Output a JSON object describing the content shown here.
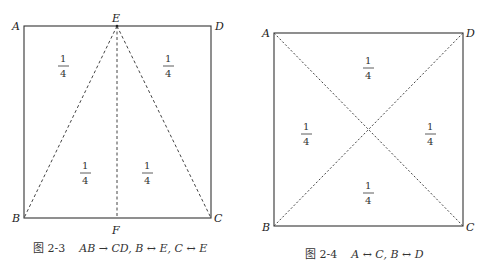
{
  "figures": [
    {
      "id": "fig-2-3",
      "points": {
        "A": "A",
        "D": "D",
        "E": "E",
        "B": "B",
        "F": "F",
        "C": "C"
      },
      "fractions": [
        {
          "num": "1",
          "den": "4"
        },
        {
          "num": "1",
          "den": "4"
        },
        {
          "num": "1",
          "den": "4"
        },
        {
          "num": "1",
          "den": "4"
        }
      ],
      "caption": {
        "label": "图 2-3",
        "math": "AB → CD, B ↔ E, C ↔ E"
      }
    },
    {
      "id": "fig-2-4",
      "points": {
        "A": "A",
        "D": "D",
        "B": "B",
        "C": "C"
      },
      "fractions": [
        {
          "num": "1",
          "den": "4"
        },
        {
          "num": "1",
          "den": "4"
        },
        {
          "num": "1",
          "den": "4"
        },
        {
          "num": "1",
          "den": "4"
        }
      ],
      "caption": {
        "label": "图 2-4",
        "math": "A ↔ C, B ↔ D"
      }
    }
  ],
  "colors": {
    "line": "#333333",
    "dashed": "#444444"
  }
}
